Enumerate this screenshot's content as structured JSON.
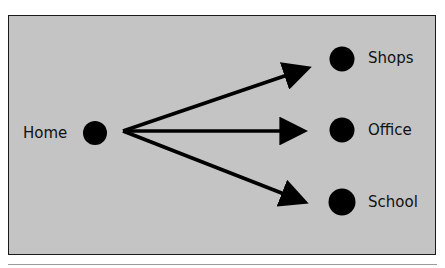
{
  "diagram": {
    "source": {
      "label": "Home"
    },
    "targets": [
      {
        "label": "Shops"
      },
      {
        "label": "Office"
      },
      {
        "label": "School"
      }
    ],
    "colors": {
      "background": "#c4c4c4",
      "node": "#000000",
      "border": "#1a1a1a"
    }
  }
}
